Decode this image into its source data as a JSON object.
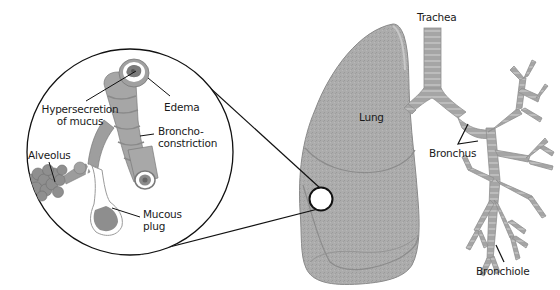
{
  "diagram": {
    "colors": {
      "tissue": "#a9a9a9",
      "tissue_dark": "#8e8e8e",
      "tissue_light": "#bdbdbd",
      "outline": "#111111",
      "mucus": "#ffffff",
      "background": "#ffffff"
    },
    "labels": {
      "trachea": "Trachea",
      "lung": "Lung",
      "bronchus": "Bronchus",
      "bronchiole": "Bronchiole",
      "hypersecretion_line1": "Hypersecretion",
      "hypersecretion_line2": "of mucus",
      "edema": "Edema",
      "bronchoconstriction_line1": "Broncho-",
      "bronchoconstriction_line2": "constriction",
      "alveolus": "Alveolus",
      "mucous_plug_line1": "Mucous",
      "mucous_plug_line2": "plug"
    }
  }
}
